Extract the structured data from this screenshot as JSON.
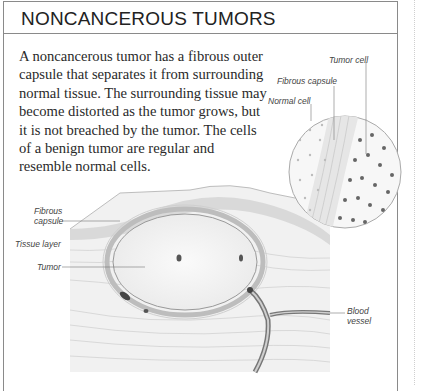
{
  "title": "NONCANCEROUS TUMORS",
  "body": "A noncancerous tumor has a fibrous outer capsule that separates it from surrounding normal tissue. The surrounding tissue may become distorted as the tumor grows, but it is not breached by the tumor. The cells of a benign tumor are regular and resemble normal cells.",
  "illustration": {
    "inset_labels": {
      "tumor_cell": "Tumor cell",
      "fibrous_capsule": "Fibrous capsule",
      "normal_cell": "Normal cell"
    },
    "main_labels": {
      "fibrous_capsule_1": "Fibrous",
      "fibrous_capsule_2": "capsule",
      "tissue_layer": "Tissue layer",
      "tumor": "Tumor",
      "blood_vessel_1": "Blood",
      "blood_vessel_2": "vessel"
    }
  }
}
